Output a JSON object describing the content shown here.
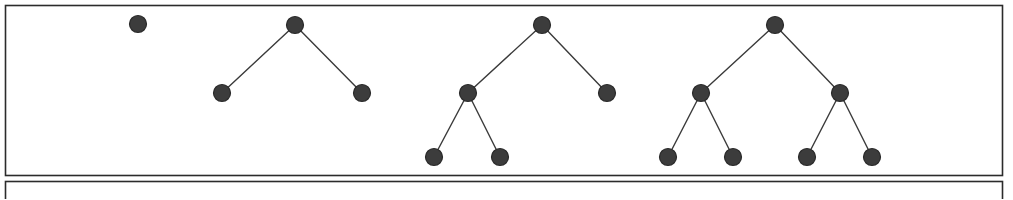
{
  "figure": {
    "width": 1013,
    "height": 199,
    "background_color": "#ffffff"
  },
  "style": {
    "node_fill": "#3c3c3c",
    "node_stroke": "#2a2a2a",
    "node_radius": 8.5,
    "node_stroke_width": 1.2,
    "edge_color": "#3a3a3a",
    "edge_width": 1.4,
    "frame_color": "#2b2b2b",
    "frame_width": 1.6
  },
  "frames": [
    {
      "name": "upper-panel",
      "x": 5.5,
      "y": 5.5,
      "width": 997,
      "height": 170
    },
    {
      "name": "lower-panel",
      "x": 5.5,
      "y": 181.5,
      "width": 997,
      "height": 60
    }
  ],
  "trees": [
    {
      "name": "tree-single-node",
      "label": "Tree 1",
      "node_count": 1,
      "depth": 1,
      "nodes": [
        {
          "id": "t1-n1",
          "name": "root",
          "x": 138,
          "y": 24
        }
      ],
      "edges": []
    },
    {
      "name": "tree-two-children",
      "label": "Tree 2",
      "node_count": 3,
      "depth": 2,
      "nodes": [
        {
          "id": "t2-n1",
          "name": "root",
          "x": 295,
          "y": 25
        },
        {
          "id": "t2-n2",
          "name": "left-child",
          "x": 222,
          "y": 93
        },
        {
          "id": "t2-n3",
          "name": "right-child",
          "x": 362,
          "y": 93
        }
      ],
      "edges": [
        {
          "from": "t2-n1",
          "to": "t2-n2"
        },
        {
          "from": "t2-n1",
          "to": "t2-n3"
        }
      ]
    },
    {
      "name": "tree-left-heavy",
      "label": "Tree 3",
      "node_count": 5,
      "depth": 3,
      "nodes": [
        {
          "id": "t3-n1",
          "name": "root",
          "x": 542,
          "y": 25
        },
        {
          "id": "t3-n2",
          "name": "left-child",
          "x": 468,
          "y": 93
        },
        {
          "id": "t3-n3",
          "name": "right-child",
          "x": 607,
          "y": 93
        },
        {
          "id": "t3-n4",
          "name": "left-left-grandchild",
          "x": 434,
          "y": 157
        },
        {
          "id": "t3-n5",
          "name": "left-right-grandchild",
          "x": 500,
          "y": 157
        }
      ],
      "edges": [
        {
          "from": "t3-n1",
          "to": "t3-n2"
        },
        {
          "from": "t3-n1",
          "to": "t3-n3"
        },
        {
          "from": "t3-n2",
          "to": "t3-n4"
        },
        {
          "from": "t3-n2",
          "to": "t3-n5"
        }
      ]
    },
    {
      "name": "tree-complete",
      "label": "Tree 4",
      "node_count": 7,
      "depth": 3,
      "nodes": [
        {
          "id": "t4-n1",
          "name": "root",
          "x": 775,
          "y": 25
        },
        {
          "id": "t4-n2",
          "name": "left-child",
          "x": 701,
          "y": 93
        },
        {
          "id": "t4-n3",
          "name": "right-child",
          "x": 840,
          "y": 93
        },
        {
          "id": "t4-n4",
          "name": "left-left-grandchild",
          "x": 668,
          "y": 157
        },
        {
          "id": "t4-n5",
          "name": "left-right-grandchild",
          "x": 733,
          "y": 157
        },
        {
          "id": "t4-n6",
          "name": "right-left-grandchild",
          "x": 807,
          "y": 157
        },
        {
          "id": "t4-n7",
          "name": "right-right-grandchild",
          "x": 872,
          "y": 157
        }
      ],
      "edges": [
        {
          "from": "t4-n1",
          "to": "t4-n2"
        },
        {
          "from": "t4-n1",
          "to": "t4-n3"
        },
        {
          "from": "t4-n2",
          "to": "t4-n4"
        },
        {
          "from": "t4-n2",
          "to": "t4-n5"
        },
        {
          "from": "t4-n3",
          "to": "t4-n6"
        },
        {
          "from": "t4-n3",
          "to": "t4-n7"
        }
      ]
    }
  ]
}
